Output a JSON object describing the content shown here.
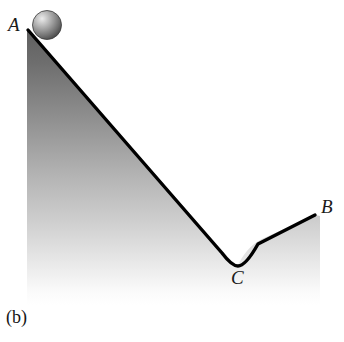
{
  "figure": {
    "caption": "(b)",
    "canvas": {
      "width": 344,
      "height": 342,
      "background": "#ffffff"
    },
    "labels": {
      "A": "A",
      "B": "B",
      "C": "C"
    },
    "points": {
      "A": {
        "label": "A",
        "x": 28,
        "y": 30,
        "role": "start-top-of-incline"
      },
      "B": {
        "label": "B",
        "x": 315,
        "y": 215,
        "role": "end-top-of-right-ramp"
      },
      "C": {
        "label": "C",
        "x": 237,
        "y": 266,
        "role": "valley-bottom"
      }
    },
    "ball": {
      "name": "rolling-ball",
      "center_x": 47,
      "center_y": 25,
      "radius": 14.5,
      "highlight_color": "#e8e8e8",
      "mid_color": "#9a9a9a",
      "edge_color": "#4a4a4a"
    },
    "surface": {
      "stroke_color": "#000000",
      "stroke_width": 3.4
    },
    "fill": {
      "top_color": "#6a6a6a",
      "mid_color": "#b5b5b5",
      "bottom_color": "#ffffff"
    }
  }
}
